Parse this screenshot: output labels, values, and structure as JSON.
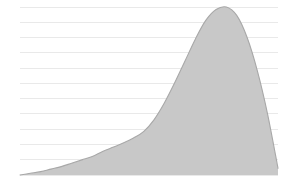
{
  "chart_data": {
    "type": "area",
    "title": "",
    "subtitle": "",
    "xlabel": "",
    "ylabel": "",
    "grid": true,
    "gridlines_horizontal": 12,
    "legend": null,
    "legend_position": "none",
    "tick_labels_x": [],
    "tick_labels_y": [],
    "annotations": [],
    "xlim": [
      0,
      100
    ],
    "ylim": [
      0,
      1
    ],
    "x": [
      0,
      4,
      8,
      12,
      16,
      20,
      24,
      28,
      32,
      36,
      40,
      44,
      48,
      52,
      56,
      60,
      64,
      68,
      72,
      76,
      80,
      84,
      88,
      92,
      96,
      100
    ],
    "values": [
      0.0,
      0.01,
      0.02,
      0.035,
      0.05,
      0.07,
      0.09,
      0.11,
      0.14,
      0.165,
      0.19,
      0.22,
      0.26,
      0.33,
      0.43,
      0.55,
      0.68,
      0.81,
      0.92,
      0.985,
      1.0,
      0.95,
      0.82,
      0.62,
      0.36,
      0.04
    ],
    "series": [
      {
        "name": "density",
        "fill_color": "#c8c8c8",
        "stroke_color": "#a8a8a8",
        "values": [
          0.0,
          0.01,
          0.02,
          0.035,
          0.05,
          0.07,
          0.09,
          0.11,
          0.14,
          0.165,
          0.19,
          0.22,
          0.26,
          0.33,
          0.43,
          0.55,
          0.68,
          0.81,
          0.92,
          0.985,
          1.0,
          0.95,
          0.82,
          0.62,
          0.36,
          0.04
        ]
      }
    ],
    "colors": {
      "background": "#ffffff",
      "fill": "#c8c8c8",
      "stroke": "#a8a8a8",
      "gridline": "#e9e9e9"
    },
    "plot_area": {
      "left": 20,
      "right": 278,
      "top": 7,
      "bottom": 175
    }
  }
}
